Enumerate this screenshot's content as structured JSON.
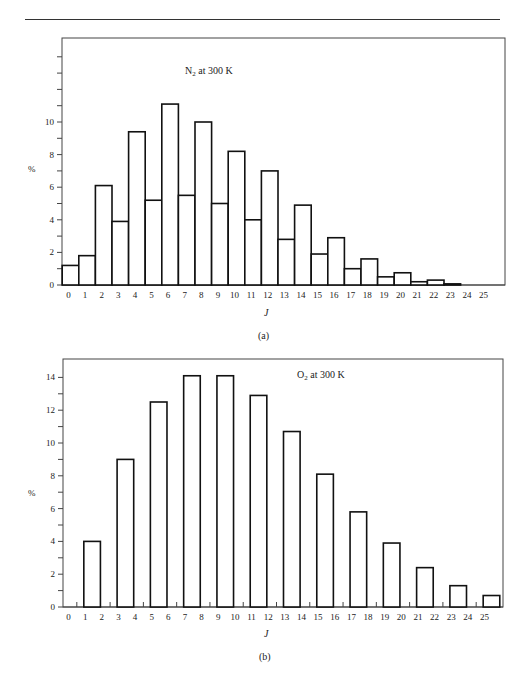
{
  "chart_data": [
    {
      "id": "a",
      "type": "bar",
      "title": "N2 at 300 K",
      "title_main": "N",
      "title_sub": "2",
      "title_rest": " at 300 K",
      "xlabel": "J",
      "ylabel": "%",
      "caption": "(a)",
      "ylim": [
        0,
        14
      ],
      "yticks_labeled": [
        0,
        2,
        4,
        6,
        8,
        10
      ],
      "yticks_minor_step": 1,
      "grid": false,
      "categories": [
        0,
        1,
        2,
        3,
        4,
        5,
        6,
        7,
        8,
        9,
        10,
        11,
        12,
        13,
        14,
        15,
        16,
        17,
        18,
        19,
        20,
        21,
        22,
        23,
        24,
        25
      ],
      "values": [
        1.2,
        1.8,
        6.1,
        3.9,
        9.4,
        5.2,
        11.1,
        5.5,
        10.0,
        5.0,
        8.2,
        4.0,
        7.0,
        2.8,
        4.9,
        1.9,
        2.9,
        1.0,
        1.6,
        0.5,
        0.75,
        0.2,
        0.3,
        0.07,
        0,
        0
      ]
    },
    {
      "id": "b",
      "type": "bar",
      "title": "O2 at 300 K",
      "title_main": "O",
      "title_sub": "2",
      "title_rest": " at 300 K",
      "xlabel": "J",
      "ylabel": "%",
      "caption": "(b)",
      "ylim": [
        0,
        14.6
      ],
      "yticks_labeled": [
        0,
        2,
        4,
        6,
        8,
        10,
        12,
        14
      ],
      "yticks_minor_step": 1,
      "grid": false,
      "categories": [
        0,
        1,
        2,
        3,
        4,
        5,
        6,
        7,
        8,
        9,
        10,
        11,
        12,
        13,
        14,
        15,
        16,
        17,
        18,
        19,
        20,
        21,
        22,
        23,
        24,
        25
      ],
      "values": [
        0,
        4.0,
        0,
        9.0,
        0,
        12.5,
        0,
        14.1,
        0,
        14.1,
        0,
        12.9,
        0,
        10.7,
        0,
        8.1,
        0,
        5.8,
        0,
        3.9,
        0,
        2.4,
        0,
        1.3,
        0,
        0.7
      ]
    }
  ]
}
